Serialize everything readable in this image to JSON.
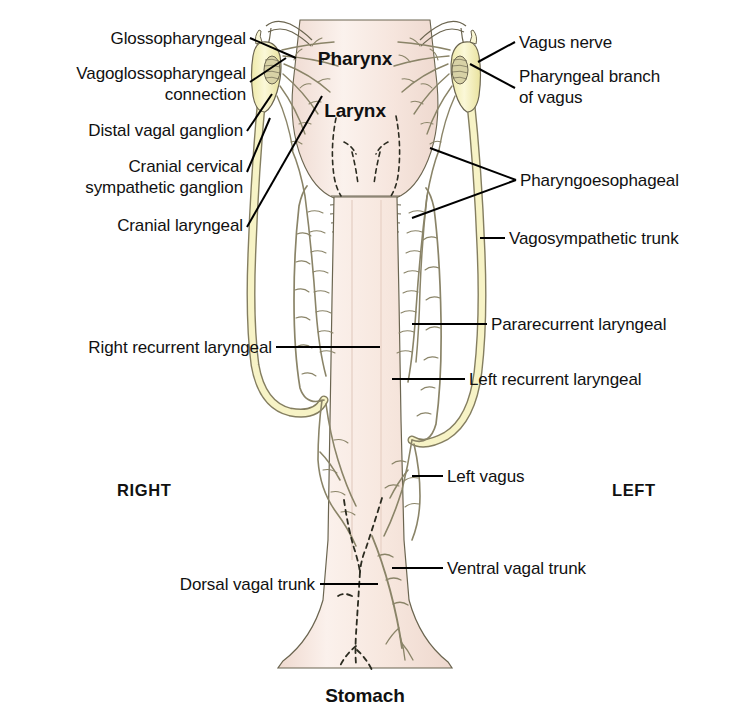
{
  "figure": {
    "background_color": "#ffffff",
    "colors": {
      "esophagus_fill": "#f6e3da",
      "esophagus_fill_light": "#faf0ea",
      "pharynx_fill": "#f4e2db",
      "ganglion_fill": "#f7f4c4",
      "nerve_trunk_fill": "#f3efc0",
      "nerve_line": "#8a8468",
      "outline": "#6b6550",
      "leader_line": "#000000",
      "text": "#111111"
    }
  },
  "organ_labels": [
    {
      "id": "pharynx",
      "text": "Pharynx",
      "x": 332,
      "y": 59
    },
    {
      "id": "larynx",
      "text": "Larynx",
      "x": 337,
      "y": 111
    },
    {
      "id": "stomach",
      "text": "Stomach",
      "x": 323,
      "y": 690
    }
  ],
  "side_labels": [
    {
      "id": "right",
      "text": "RIGHT",
      "x": 117,
      "y": 473
    },
    {
      "id": "left",
      "text": "LEFT",
      "x": 612,
      "y": 473
    }
  ],
  "left_labels": [
    {
      "id": "glossopharyngeal",
      "lines": [
        "Glossopharyngeal"
      ],
      "text": "Glossopharyngeal",
      "right_edge": 246,
      "top": 28
    },
    {
      "id": "vagoglossopharyngeal-connection",
      "lines": [
        "Vagoglossopharyngeal",
        "connection"
      ],
      "text": "Vagoglossopharyngeal connection",
      "right_edge": 246,
      "top": 63
    },
    {
      "id": "distal-vagal-ganglion",
      "lines": [
        "Distal vagal ganglion"
      ],
      "text": "Distal vagal ganglion",
      "right_edge": 243,
      "top": 120
    },
    {
      "id": "cranial-cervical-sympathetic-ganglion",
      "lines": [
        "Cranial cervical",
        "sympathetic ganglion"
      ],
      "text": "Cranial cervical sympathetic ganglion",
      "right_edge": 243,
      "top": 156
    },
    {
      "id": "cranial-laryngeal",
      "lines": [
        "Cranial laryngeal"
      ],
      "text": "Cranial laryngeal",
      "right_edge": 243,
      "top": 215
    },
    {
      "id": "right-recurrent-laryngeal",
      "lines": [
        "Right recurrent laryngeal"
      ],
      "text": "Right recurrent laryngeal",
      "right_edge": 272,
      "top": 337
    },
    {
      "id": "dorsal-vagal-trunk",
      "lines": [
        "Dorsal vagal trunk"
      ],
      "text": "Dorsal vagal trunk",
      "right_edge": 315,
      "top": 574
    }
  ],
  "right_labels": [
    {
      "id": "vagus-nerve",
      "lines": [
        "Vagus nerve"
      ],
      "text": "Vagus nerve",
      "left_edge": 519,
      "top": 32
    },
    {
      "id": "pharyngeal-branch-of-vagus",
      "lines": [
        "Pharyngeal branch",
        "of vagus"
      ],
      "text": "Pharyngeal branch of vagus",
      "left_edge": 519,
      "top": 66
    },
    {
      "id": "pharyngoesophageal",
      "lines": [
        "Pharyngoesophageal"
      ],
      "text": "Pharyngoesophageal",
      "left_edge": 520,
      "top": 170
    },
    {
      "id": "vagosympathetic-trunk",
      "lines": [
        "Vagosympathetic trunk"
      ],
      "text": "Vagosympathetic trunk",
      "left_edge": 509,
      "top": 228
    },
    {
      "id": "pararecurrent-laryngeal",
      "lines": [
        "Pararecurrent laryngeal"
      ],
      "text": "Pararecurrent laryngeal",
      "left_edge": 491,
      "top": 314
    },
    {
      "id": "left-recurrent-laryngeal",
      "lines": [
        "Left recurrent laryngeal"
      ],
      "text": "Left recurrent laryngeal",
      "left_edge": 469,
      "top": 369
    },
    {
      "id": "left-vagus",
      "lines": [
        "Left vagus"
      ],
      "text": "Left vagus",
      "left_edge": 447,
      "top": 466
    },
    {
      "id": "ventral-vagal-trunk",
      "lines": [
        "Ventral vagal trunk"
      ],
      "text": "Ventral vagal trunk",
      "left_edge": 447,
      "top": 558
    }
  ]
}
